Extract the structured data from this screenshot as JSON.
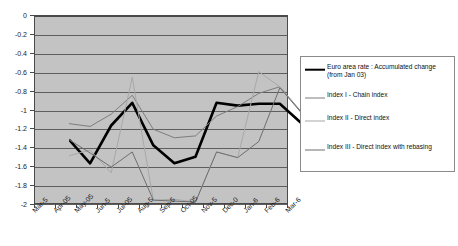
{
  "chart_data": {
    "type": "line",
    "title": "",
    "xlabel": "",
    "ylabel": "",
    "ylim": [
      -2,
      0
    ],
    "ytick_step": 0.2,
    "grid": true,
    "legend_position": "right",
    "plot_background": "#c3c3c3",
    "categories": [
      "Mar-5",
      "Apr-05",
      "May-05",
      "Jun-5",
      "Jul-05",
      "Aug-5",
      "Sep-5",
      "Oct-05",
      "Nov-5",
      "Dec-0",
      "Jan-6",
      "Feb-6",
      "Mar-6"
    ],
    "ytick_labels": [
      "0",
      "-0.2",
      "-0.4",
      "-0.6",
      "-0.8",
      "-1",
      "-1.2",
      "-1.4",
      "-1.6",
      "-1.8",
      "-2"
    ],
    "ytick_values": [
      0,
      -0.2,
      -0.4,
      -0.6,
      -0.8,
      -1,
      -1.2,
      -1.4,
      -1.6,
      -1.8,
      -2
    ],
    "series": [
      {
        "name": "Euro area rate : Accumulated change\n(from Jan 03)",
        "color": "#000000",
        "width": 2.6,
        "values": [
          -1.15,
          -1.4,
          -1.0,
          -0.76,
          -1.21,
          -1.4,
          -1.33,
          -0.76,
          -0.79,
          -0.77,
          -0.77,
          -0.97,
          -1.03
        ]
      },
      {
        "name": "Index I - Chain index",
        "color": "#7d7d7d",
        "width": 1.0,
        "values": [
          -0.98,
          -1.01,
          -0.88,
          -0.68,
          -1.04,
          -1.13,
          -1.11,
          -0.9,
          -0.8,
          -0.66,
          -0.59,
          -0.85,
          -0.85
        ]
      },
      {
        "name": "Index II - Direct index",
        "color": "#a8a8a8",
        "width": 1.0,
        "values": [
          -1.32,
          -1.26,
          -1.5,
          -0.49,
          -1.79,
          -1.78,
          -1.81,
          -1.28,
          -1.34,
          -0.43,
          -0.59,
          -0.86,
          -0.7
        ]
      },
      {
        "name": "Index III - Direct index with rebasing",
        "color": "#6e6e6e",
        "width": 1.0,
        "values": [
          -1.15,
          -1.29,
          -1.44,
          -1.28,
          -1.79,
          -1.8,
          -1.81,
          -1.28,
          -1.34,
          -1.17,
          -0.6,
          -0.86,
          -0.85
        ]
      }
    ]
  },
  "legend": {
    "items": [
      {
        "label": "Euro area rate : Accumulated change\n(from Jan 03)",
        "color": "#000000",
        "thickness": "2.6px",
        "icon": "legend-line-swatch"
      },
      {
        "label": "Index I - Chain index",
        "color": "#7d7d7d",
        "thickness": "1px",
        "icon": "legend-line-swatch"
      },
      {
        "label": "Index II - Direct index",
        "color": "#a8a8a8",
        "thickness": "1px",
        "icon": "legend-line-swatch"
      },
      {
        "label": "Index III - Direct index with rebasing",
        "color": "#6e6e6e",
        "thickness": "1px",
        "icon": "legend-line-swatch"
      }
    ]
  }
}
